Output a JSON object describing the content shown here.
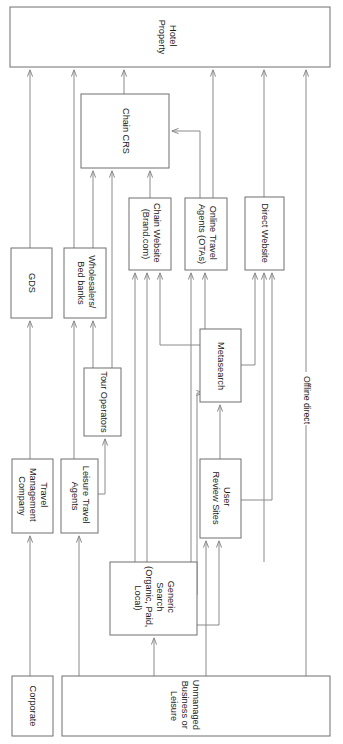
{
  "diagram": {
    "orientation": "rotated-90",
    "canvas": {
      "width": 343,
      "height": 744
    },
    "colors": {
      "box_stroke": "#6f6f6f",
      "connector": "#8a8a8a",
      "text": "#1c1c1c",
      "background": "#ffffff"
    },
    "nodes": [
      {
        "id": "hotel-property",
        "label": "Hotel Property",
        "lines": [
          "Hotel",
          "Property"
        ],
        "x": 10,
        "y": 7,
        "w": 320,
        "h": 60
      },
      {
        "id": "chain-crs",
        "label": "Chain CRS",
        "lines": [
          "Chain CRS"
        ],
        "x": 81,
        "y": 94,
        "w": 88,
        "h": 74
      },
      {
        "id": "chain-website",
        "label": "Chain Website (Brand.com)",
        "lines": [
          "Chain Website",
          "(Brand.com)"
        ],
        "x": 129,
        "y": 198,
        "w": 42,
        "h": 72
      },
      {
        "id": "online-travel-agents",
        "label": "Online Travel Agents (OTAs)",
        "lines": [
          "Online Travel",
          "Agents (OTAs)"
        ],
        "x": 185,
        "y": 198,
        "w": 42,
        "h": 72
      },
      {
        "id": "direct-website",
        "label": "Direct Website",
        "lines": [
          "Direct Website"
        ],
        "x": 245,
        "y": 197,
        "w": 39,
        "h": 73
      },
      {
        "id": "gds",
        "label": "GDS",
        "lines": [
          "GDS"
        ],
        "x": 11,
        "y": 248,
        "w": 41,
        "h": 70
      },
      {
        "id": "wholesalers-bed-banks",
        "label": "Wholesalers/ Bed banks",
        "lines": [
          "Wholesalers/",
          "Bed banks"
        ],
        "x": 64,
        "y": 248,
        "w": 42,
        "h": 70
      },
      {
        "id": "metasearch",
        "label": "Metasearch",
        "lines": [
          "Metasearch"
        ],
        "x": 200,
        "y": 329,
        "w": 41,
        "h": 73
      },
      {
        "id": "tour-operators",
        "label": "Tour Operators",
        "lines": [
          "Tour Operators"
        ],
        "x": 84,
        "y": 368,
        "w": 37,
        "h": 68
      },
      {
        "id": "travel-management-company",
        "label": "Travel Management Company",
        "lines": [
          "Travel",
          "Management",
          "Company"
        ],
        "x": 12,
        "y": 459,
        "w": 41,
        "h": 74
      },
      {
        "id": "leisure-travel-agents",
        "label": "Leisure Travel Agents",
        "lines": [
          "Leisure Travel",
          "Agents"
        ],
        "x": 61,
        "y": 459,
        "w": 37,
        "h": 74
      },
      {
        "id": "user-review-sites",
        "label": "User Review Sites",
        "lines": [
          "User",
          "Review Sites"
        ],
        "x": 200,
        "y": 459,
        "w": 41,
        "h": 79
      },
      {
        "id": "generic-search",
        "label": "Generic Search (Organic, Paid, Local)",
        "lines": [
          "Generic",
          "Search",
          "(Organic, Paid,",
          "Local)"
        ],
        "x": 110,
        "y": 562,
        "w": 87,
        "h": 73
      },
      {
        "id": "corporate",
        "label": "Corporate",
        "lines": [
          "Corporate"
        ],
        "x": 12,
        "y": 676,
        "w": 41,
        "h": 60
      },
      {
        "id": "unmanaged-business-or-leisure",
        "label": "Unmanaged Business or Leisure",
        "lines": [
          "Unmanaged",
          "Business or",
          "Leisure"
        ],
        "x": 62,
        "y": 676,
        "w": 268,
        "h": 60
      }
    ],
    "edge_labels": [
      {
        "id": "offline-direct",
        "text": "Offline direct",
        "x": 306,
        "y": 400
      }
    ],
    "flows": [
      {
        "from": "corporate",
        "to": "travel-management-company"
      },
      {
        "from": "travel-management-company",
        "to": "gds"
      },
      {
        "from": "gds",
        "to": "hotel-property"
      },
      {
        "from": "unmanaged-business-or-leisure",
        "to": "leisure-travel-agents"
      },
      {
        "from": "leisure-travel-agents",
        "to": "wholesalers-bed-banks"
      },
      {
        "from": "leisure-travel-agents",
        "to": "tour-operators"
      },
      {
        "from": "wholesalers-bed-banks",
        "to": "hotel-property"
      },
      {
        "from": "wholesalers-bed-banks",
        "to": "chain-crs"
      },
      {
        "from": "tour-operators",
        "to": "wholesalers-bed-banks"
      },
      {
        "from": "tour-operators",
        "to": "chain-crs"
      },
      {
        "from": "generic-search",
        "to": "chain-website"
      },
      {
        "from": "generic-search",
        "to": "online-travel-agents"
      },
      {
        "from": "generic-search",
        "to": "direct-website"
      },
      {
        "from": "generic-search",
        "to": "metasearch"
      },
      {
        "from": "generic-search",
        "to": "user-review-sites"
      },
      {
        "from": "user-review-sites",
        "to": "metasearch"
      },
      {
        "from": "user-review-sites",
        "to": "direct-website"
      },
      {
        "from": "metasearch",
        "to": "chain-website"
      },
      {
        "from": "metasearch",
        "to": "online-travel-agents"
      },
      {
        "from": "metasearch",
        "to": "direct-website"
      },
      {
        "from": "chain-website",
        "to": "chain-crs"
      },
      {
        "from": "online-travel-agents",
        "to": "chain-crs"
      },
      {
        "from": "online-travel-agents",
        "to": "hotel-property"
      },
      {
        "from": "chain-crs",
        "to": "hotel-property"
      },
      {
        "from": "direct-website",
        "to": "hotel-property"
      },
      {
        "from": "unmanaged-business-or-leisure",
        "to": "generic-search"
      },
      {
        "from": "unmanaged-business-or-leisure",
        "to": "user-review-sites"
      },
      {
        "from": "unmanaged-business-or-leisure",
        "to": "hotel-property",
        "label": "Offline direct"
      }
    ]
  }
}
